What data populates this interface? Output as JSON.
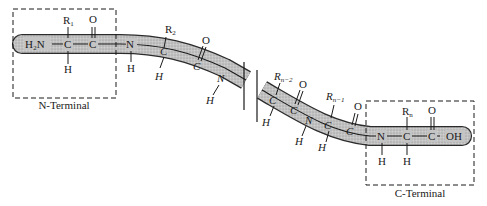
{
  "diagram": {
    "title": "",
    "colors": {
      "backbone_fill": "#b9b9b9",
      "backbone_stroke": "#3a3a3a",
      "ink": "#1a1a1a",
      "background": "#ffffff"
    },
    "n_terminal": {
      "label": "N-Terminal",
      "amine": "H₂N",
      "alpha_carbon": "C",
      "side_chain": "R",
      "side_chain_sub": "1",
      "alpha_h": "H",
      "carbonyl_carbon": "C",
      "carbonyl_oxygen": "O"
    },
    "residue_2": {
      "amide_n": "N",
      "amide_h": "H",
      "alpha_carbon": "C",
      "side_chain": "R",
      "side_chain_sub": "2",
      "alpha_h": "H",
      "carbonyl_carbon": "C",
      "carbonyl_oxygen": "O",
      "next_n": "N",
      "next_h": "H"
    },
    "break_marker": "chain break",
    "residue_n_minus_2": {
      "alpha_carbon": "C",
      "side_chain": "R",
      "side_chain_sub": "n−2",
      "alpha_h": "H",
      "carbonyl_carbon": "C",
      "carbonyl_oxygen": "O"
    },
    "residue_n_minus_1": {
      "amide_n": "N",
      "amide_h": "H",
      "alpha_carbon": "C",
      "side_chain": "R",
      "side_chain_sub": "n−1",
      "alpha_h": "H",
      "carbonyl_carbon": "C",
      "carbonyl_oxygen": "O"
    },
    "c_terminal": {
      "label": "C-Terminal",
      "amide_n": "N",
      "amide_h": "H",
      "alpha_carbon": "C",
      "side_chain": "R",
      "side_chain_sub": "n",
      "alpha_h": "H",
      "carbonyl_carbon": "C",
      "carbonyl_oxygen": "O",
      "hydroxyl": "OH"
    }
  }
}
